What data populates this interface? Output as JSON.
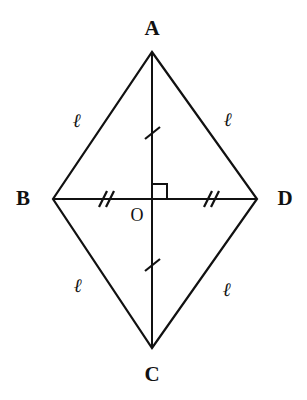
{
  "figure": {
    "kind": "rhombus-with-diagonals",
    "background_color": "#ffffff",
    "stroke_color": "#111111",
    "stroke_width": 2,
    "canvas": {
      "width": 307,
      "height": 400
    },
    "vertices": {
      "A": {
        "label": "A",
        "x": 152,
        "y": 52
      },
      "B": {
        "label": "B",
        "x": 53,
        "y": 199
      },
      "C": {
        "label": "C",
        "x": 152,
        "y": 348
      },
      "D": {
        "label": "D",
        "x": 257,
        "y": 199
      }
    },
    "center": {
      "label": "O",
      "x": 152,
      "y": 199
    },
    "sides": [
      {
        "name": "AB",
        "label": "ℓ",
        "label_x": 77,
        "label_y": 122
      },
      {
        "name": "AD",
        "label": "ℓ",
        "label_x": 228,
        "label_y": 120
      },
      {
        "name": "BC",
        "label": "ℓ",
        "label_x": 78,
        "label_y": 287
      },
      {
        "name": "CD",
        "label": "ℓ",
        "label_x": 227,
        "label_y": 291
      }
    ],
    "diagonals": [
      {
        "name": "AC",
        "from": "A",
        "to": "C",
        "tick_count": 1
      },
      {
        "name": "BD",
        "from": "B",
        "to": "D",
        "tick_count": 2
      }
    ],
    "tick_marks": {
      "single_on_vertical": [
        {
          "x": 152,
          "y": 133
        },
        {
          "x": 152,
          "y": 265
        }
      ],
      "double_on_horizontal": [
        {
          "x": 103,
          "y": 199
        },
        {
          "x": 208,
          "y": 199
        }
      ]
    },
    "right_angle_marker": {
      "present": true,
      "quadrant": "upper-right-of-center",
      "size": 15,
      "x": 152,
      "y": 199
    }
  }
}
